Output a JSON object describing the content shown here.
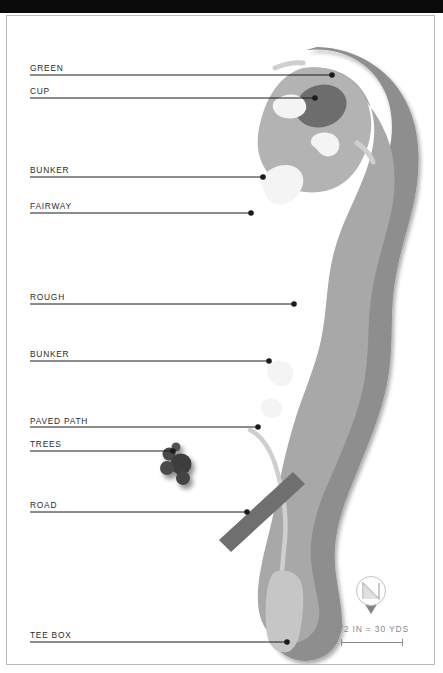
{
  "document": {
    "type": "golf-hole-diagram",
    "title": "Golf Hole Map"
  },
  "callouts": [
    {
      "label": "GREEN",
      "label_x": 29,
      "label_y": 62,
      "line_y": 74,
      "line_x2": 331,
      "dot_x": 331,
      "dot_y": 74
    },
    {
      "label": "CUP",
      "label_x": 29,
      "label_y": 85,
      "line_y": 97,
      "line_x2": 314,
      "dot_x": 314,
      "dot_y": 97
    },
    {
      "label": "BUNKER",
      "label_x": 29,
      "label_y": 164,
      "line_y": 176,
      "line_x2": 262,
      "dot_x": 262,
      "dot_y": 176
    },
    {
      "label": "FAIRWAY",
      "label_x": 29,
      "label_y": 200,
      "line_y": 212,
      "line_x2": 250,
      "dot_x": 250,
      "dot_y": 212
    },
    {
      "label": "ROUGH",
      "label_x": 29,
      "label_y": 291,
      "line_y": 303,
      "line_x2": 293,
      "dot_x": 293,
      "dot_y": 303
    },
    {
      "label": "BUNKER",
      "label_x": 29,
      "label_y": 348,
      "line_y": 360,
      "line_x2": 268,
      "dot_x": 268,
      "dot_y": 360
    },
    {
      "label": "PAVED PATH",
      "label_x": 29,
      "label_y": 415,
      "line_y": 426,
      "line_x2": 257,
      "dot_x": 257,
      "dot_y": 426
    },
    {
      "label": "TREES",
      "label_x": 29,
      "label_y": 438,
      "line_y": 450,
      "line_x2": 172,
      "dot_x": 172,
      "dot_y": 450
    },
    {
      "label": "ROAD",
      "label_x": 29,
      "label_y": 499,
      "line_y": 511,
      "line_x2": 246,
      "dot_x": 246,
      "dot_y": 511
    },
    {
      "label": "TEE BOX",
      "label_x": 29,
      "label_y": 629,
      "line_y": 641,
      "line_x2": 286,
      "dot_x": 286,
      "dot_y": 641
    }
  ],
  "legend": {
    "scale_text": "1/2 IN = 30 YDS",
    "compass_letter": "N"
  },
  "colors": {
    "rough": "#8e8e8e",
    "fairway": "#a8a8a8",
    "green": "#b3b3b3",
    "cup": "#6d6d6d",
    "bunker": "#f4f4f4",
    "road": "#6f6f6f",
    "path": "#cfcfcf",
    "trees": "#4a4a4a",
    "callout_line": "#1b1b1b",
    "label_text": "#2b2b2b",
    "legend_text": "#8a8a8a",
    "frame": "#b9b9b9",
    "topbar": "#0b0b0b",
    "page": "#ffffff"
  }
}
